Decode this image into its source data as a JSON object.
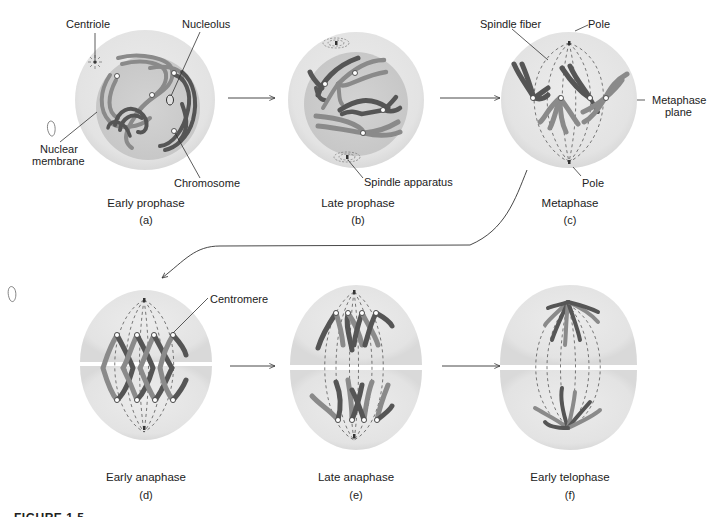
{
  "figure": {
    "caption_partial": "FIGURE 1.5",
    "colors": {
      "background": "#ffffff",
      "cytoplasm": "#e9e9e9",
      "nucleus": "#cfcfcf",
      "chromatid_dark": "#555555",
      "chromatid_light": "#8a8a8a",
      "line": "#333333"
    },
    "panels": [
      {
        "id": "a",
        "title": "Early prophase",
        "letter": "(a)"
      },
      {
        "id": "b",
        "title": "Late prophase",
        "letter": "(b)"
      },
      {
        "id": "c",
        "title": "Metaphase",
        "letter": "(c)"
      },
      {
        "id": "d",
        "title": "Early anaphase",
        "letter": "(d)"
      },
      {
        "id": "e",
        "title": "Late anaphase",
        "letter": "(e)"
      },
      {
        "id": "f",
        "title": "Early telophase",
        "letter": "(f)"
      }
    ],
    "labels": {
      "centriole": "Centriole",
      "nucleolus": "Nucleolus",
      "nuclear_membrane_1": "Nuclear",
      "nuclear_membrane_2": "membrane",
      "chromosome": "Chromosome",
      "spindle_apparatus": "Spindle apparatus",
      "spindle_fiber": "Spindle fiber",
      "pole_top": "Pole",
      "pole_bottom": "Pole",
      "metaphase_plane_1": "Metaphase",
      "metaphase_plane_2": "plane",
      "centromere": "Centromere"
    },
    "arrows": [
      {
        "from": "a",
        "to": "b"
      },
      {
        "from": "b",
        "to": "c"
      },
      {
        "from": "c",
        "to": "d"
      },
      {
        "from": "d",
        "to": "e"
      },
      {
        "from": "e",
        "to": "f"
      }
    ]
  }
}
